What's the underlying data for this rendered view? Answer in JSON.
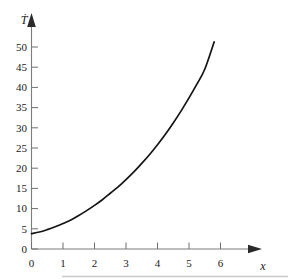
{
  "chart_data": {
    "type": "line",
    "title": "",
    "subtitle": "",
    "xlabel": "x",
    "ylabel": "Ṫ",
    "ylabel_plain": "T-dot",
    "xlim": [
      0,
      7.1
    ],
    "ylim": [
      0,
      53
    ],
    "grid": false,
    "legend": null,
    "x_ticks": [
      0,
      1,
      2,
      3,
      4,
      5,
      6
    ],
    "x_tick_labels": [
      "0",
      "1",
      "2",
      "3",
      "4",
      "5",
      "6"
    ],
    "y_ticks": [
      0,
      5,
      10,
      15,
      20,
      25,
      30,
      35,
      40,
      45,
      50
    ],
    "y_tick_labels": [
      "0",
      "5",
      "10",
      "15",
      "20",
      "25",
      "30",
      "35",
      "40",
      "45",
      "50"
    ],
    "series": [
      {
        "name": "T-dot curve",
        "color": "#141414",
        "x": [
          0,
          0.25,
          0.5,
          0.75,
          1,
          1.25,
          1.5,
          1.75,
          2,
          2.25,
          2.5,
          2.75,
          3,
          3.25,
          3.5,
          3.75,
          4,
          4.25,
          4.5,
          4.75,
          5,
          5.25,
          5.5,
          5.8
        ],
        "values": [
          3.8,
          4.2,
          4.8,
          5.5,
          6.3,
          7.2,
          8.3,
          9.5,
          10.8,
          12.2,
          13.8,
          15.4,
          17.2,
          19.1,
          21.2,
          23.4,
          25.8,
          28.4,
          31.2,
          34.2,
          37.4,
          40.8,
          44.5,
          51.3
        ]
      }
    ],
    "axis_style": {
      "x_axis_arrow": true,
      "y_axis_arrow": true,
      "ticks_inward": true
    }
  },
  "figure": {
    "background_color": "#ffffff",
    "axis_color": "#2a2a2a",
    "curve_color": "#141414",
    "tick_color": "#6f6f6f",
    "footer_rule_color": "#c8c8c8"
  }
}
